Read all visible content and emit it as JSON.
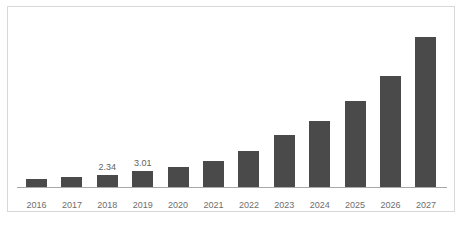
{
  "chart_data": {
    "type": "bar",
    "title": "",
    "subtitle": "",
    "xlabel": "",
    "ylabel": "",
    "grid": false,
    "legend": false,
    "axis": {
      "y_axis_visible": false,
      "x_axis_line": true,
      "ylim": [
        0,
        28.8
      ]
    },
    "categories": [
      "2016",
      "2017",
      "2018",
      "2019",
      "2020",
      "2021",
      "2022",
      "2023",
      "2024",
      "2025",
      "2026",
      "2027"
    ],
    "values": [
      1.5,
      1.8,
      2.34,
      3.01,
      3.7,
      4.9,
      6.7,
      9.7,
      12.3,
      16.1,
      20.8,
      28.0
    ],
    "data_labels": [
      "",
      "",
      "2.34",
      "3.01",
      "",
      "",
      "",
      "",
      "",
      "",
      "",
      ""
    ],
    "colors": {
      "bar": "#4a4a4a",
      "axis_line": "#a9a9a9",
      "frame_border": "#d8d8d8",
      "tick_label": "#6e6e6e",
      "data_label": "#5f5f5f",
      "background": "#ffffff"
    }
  }
}
